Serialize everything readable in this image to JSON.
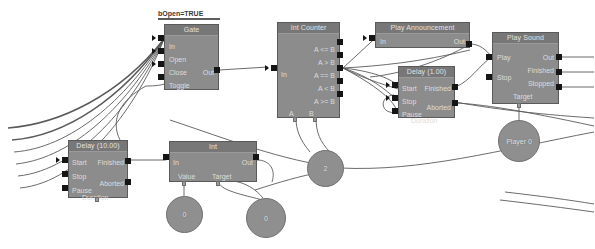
{
  "canvas": {
    "width": 595,
    "height": 249,
    "background": "#ffffff",
    "wire_color": "#5a5a5a",
    "node_fill": "#8c8c8c",
    "node_header_fill": "#777777",
    "pin_color": "#151515",
    "text_color": "#dcdcdc"
  },
  "comments": [
    {
      "text": "bOpen=TRUE"
    }
  ],
  "nodes": [
    {
      "id": "gate",
      "title": "Gate",
      "inputs": [
        "In",
        "Open",
        "Close",
        "Toggle"
      ],
      "outputs": [
        "Out"
      ],
      "bottom_pins": []
    },
    {
      "id": "int-counter",
      "title": "Int Counter",
      "inputs": [
        "In"
      ],
      "outputs": [
        "A <= B",
        "A > B",
        "A == B",
        "A < B",
        "A >= B"
      ],
      "bottom_pins": [
        "A",
        "B"
      ]
    },
    {
      "id": "play-announcement",
      "title": "Play Announcement",
      "inputs": [
        "In"
      ],
      "outputs": [
        "Out"
      ],
      "bottom_pins": []
    },
    {
      "id": "play-sound",
      "title": "Play Sound",
      "inputs": [
        "Play",
        "Stop"
      ],
      "outputs": [
        "Out",
        "Finished",
        "Stopped"
      ],
      "bottom_pins": [
        "Target"
      ]
    },
    {
      "id": "delay-1",
      "title": "Delay (1.00)",
      "inputs": [
        "Start",
        "Stop",
        "Pause"
      ],
      "outputs": [
        "Finished",
        "Aborted"
      ],
      "bottom_pins": [
        "Duration"
      ]
    },
    {
      "id": "delay-10",
      "title": "Delay (10.00)",
      "inputs": [
        "Start",
        "Stop",
        "Pause"
      ],
      "outputs": [
        "Finished",
        "Aborted"
      ],
      "bottom_pins": [
        "Duration"
      ]
    },
    {
      "id": "int",
      "title": "Int",
      "inputs": [
        "In"
      ],
      "outputs": [
        "Out"
      ],
      "bottom_pins": [
        "Value",
        "Target"
      ]
    }
  ],
  "value_nodes": [
    {
      "id": "player-0",
      "label": "Player 0"
    },
    {
      "id": "int-const-2",
      "label": "2"
    },
    {
      "id": "int-const-value",
      "label": "0"
    },
    {
      "id": "int-const-target",
      "label": "0"
    }
  ]
}
